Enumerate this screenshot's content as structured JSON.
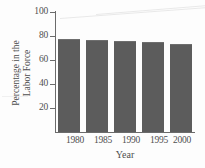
{
  "chart_data": {
    "type": "bar",
    "title": "",
    "xlabel": "Year",
    "ylabel": "Percentage in the Labor Force",
    "ylabel_lines": [
      "Percentage in the",
      "Labor Force"
    ],
    "categories": [
      "1980",
      "1985",
      "1990",
      "1995",
      "2000"
    ],
    "values": [
      77,
      76,
      75,
      74,
      73
    ],
    "ylim": [
      0,
      100
    ],
    "yticks": [
      20,
      40,
      60,
      80,
      100
    ],
    "ytick_labels": [
      "20",
      "40",
      "60",
      "80",
      "100"
    ],
    "grid": false,
    "legend": false,
    "bar_color": "#5c5c5c",
    "axis_color": "#6b6b6b",
    "background": "#fdfdfd"
  }
}
